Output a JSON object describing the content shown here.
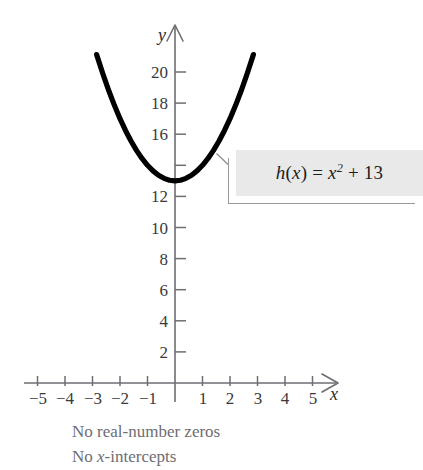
{
  "figure": {
    "callout": {
      "equation_plain": "h(x) = x² + 13",
      "fn_name": "h",
      "arg": "x",
      "equals": " = ",
      "base": "x",
      "exponent": "2",
      "plus": " + ",
      "constant": "13",
      "background_color": "#e9e9e9",
      "border_color": "#9a9a9e"
    },
    "caption": {
      "line1": "No real-number zeros",
      "line2_prefix": "No ",
      "line2_italic": "x",
      "line2_suffix": "-intercepts",
      "line2_plain": "No x-intercepts",
      "color": "#6d6d72"
    },
    "axes": {
      "x_name": "x",
      "y_name": "y",
      "axis_color": "#6e6e73",
      "curve_color": "#000000"
    }
  },
  "chart_data": {
    "type": "line",
    "subtitle": "No real-number zeros / No x-intercepts",
    "xlabel": "x",
    "ylabel": "y",
    "function": "h(x) = x^2 + 13",
    "vertex": [
      0,
      13
    ],
    "xlim": [
      -5.5,
      5.5
    ],
    "ylim": [
      0,
      22
    ],
    "grid": false,
    "legend": null,
    "x_ticks": [
      -5,
      -4,
      -3,
      -2,
      -1,
      1,
      2,
      3,
      4,
      5
    ],
    "x_tick_labels": [
      "−5",
      "−4",
      "−3",
      "−2",
      "−1",
      "1",
      "2",
      "3",
      "4",
      "5"
    ],
    "y_ticks": [
      2,
      4,
      6,
      8,
      10,
      12,
      14,
      16,
      18,
      20
    ],
    "y_tick_labels": [
      "2",
      "4",
      "6",
      "8",
      "10",
      "12",
      "",
      "16",
      "18",
      "20"
    ],
    "series": [
      {
        "name": "h(x) = x² + 13",
        "x": [
          -2.85,
          -2.6,
          -2.4,
          -2.2,
          -2.0,
          -1.8,
          -1.6,
          -1.4,
          -1.2,
          -1.0,
          -0.8,
          -0.6,
          -0.4,
          -0.2,
          0,
          0.2,
          0.4,
          0.6,
          0.8,
          1.0,
          1.2,
          1.4,
          1.6,
          1.8,
          2.0,
          2.2,
          2.4,
          2.6,
          2.85
        ],
        "y": [
          21.12,
          19.76,
          18.76,
          17.84,
          17.0,
          16.24,
          15.56,
          14.96,
          14.44,
          14.0,
          13.64,
          13.36,
          13.16,
          13.04,
          13.0,
          13.04,
          13.16,
          13.36,
          13.64,
          14.0,
          14.44,
          14.96,
          15.56,
          16.24,
          17.0,
          17.84,
          18.76,
          19.76,
          21.12
        ]
      }
    ],
    "annotations": [
      {
        "text": "h(x) = x² + 13",
        "type": "callout-box",
        "points_at": [
          1.55,
          14.6
        ]
      },
      {
        "text": "No real-number zeros",
        "type": "caption"
      },
      {
        "text": "No x-intercepts",
        "type": "caption"
      }
    ]
  },
  "ticks": {
    "y": [
      {
        "label": "20",
        "value": 20
      },
      {
        "label": "18",
        "value": 18
      },
      {
        "label": "16",
        "value": 16
      },
      {
        "label": "",
        "value": 14
      },
      {
        "label": "12",
        "value": 12
      },
      {
        "label": "10",
        "value": 10
      },
      {
        "label": "8",
        "value": 8
      },
      {
        "label": "6",
        "value": 6
      },
      {
        "label": "4",
        "value": 4
      },
      {
        "label": "2",
        "value": 2
      }
    ],
    "x": [
      {
        "label": "−5",
        "value": -5
      },
      {
        "label": "−4",
        "value": -4
      },
      {
        "label": "−3",
        "value": -3
      },
      {
        "label": "−2",
        "value": -2
      },
      {
        "label": "−1",
        "value": -1
      },
      {
        "label": "1",
        "value": 1
      },
      {
        "label": "2",
        "value": 2
      },
      {
        "label": "3",
        "value": 3
      },
      {
        "label": "4",
        "value": 4
      },
      {
        "label": "5",
        "value": 5
      }
    ]
  }
}
